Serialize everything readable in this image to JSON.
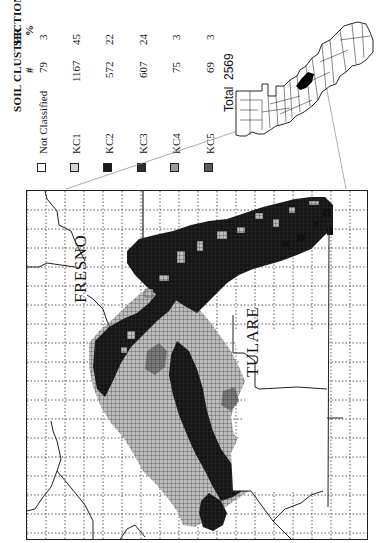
{
  "legend": {
    "header_cluster": "SOIL CLUSTER",
    "header_sections": "SECTIONS",
    "header_count": "#",
    "header_percent": "%",
    "rows": [
      {
        "label": "Not Classified",
        "count": "79",
        "percent": "3",
        "color": "#ffffff"
      },
      {
        "label": "KC1",
        "count": "1167",
        "percent": "45",
        "color": "#d4d4d4"
      },
      {
        "label": "KC2",
        "count": "572",
        "percent": "22",
        "color": "#1a1a1a"
      },
      {
        "label": "KC3",
        "count": "607",
        "percent": "24",
        "color": "#2e2e2e"
      },
      {
        "label": "KC4",
        "count": "75",
        "percent": "3",
        "color": "#9a9a9a"
      },
      {
        "label": "KC5",
        "count": "69",
        "percent": "3",
        "color": "#5a5a5a"
      }
    ],
    "total_label": "Total",
    "total_value": "2569"
  },
  "map": {
    "labels": {
      "fresno": "FRESNO",
      "tulare": "TULARE"
    },
    "orientation": "rotated 90 degrees counter-clockwise",
    "inset": "California counties locator map with study area highlighted"
  }
}
